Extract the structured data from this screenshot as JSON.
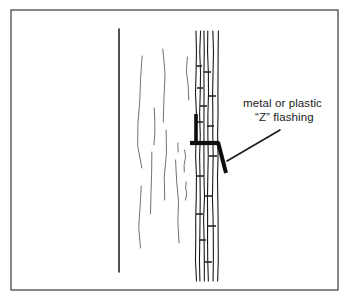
{
  "figure": {
    "name": "z-flashing-detail",
    "type": "architectural-detail-line-drawing",
    "background_color": "#ffffff",
    "ink_color": "#1a1a1a",
    "sketch_color": "#555555"
  },
  "frame": {
    "name": "border-rectangle",
    "x": 11,
    "y": 10,
    "width": 327,
    "height": 280,
    "stroke_color": "#3a3a3a",
    "stroke_width": 1.2
  },
  "annotation": {
    "label_line_1": "metal or plastic",
    "label_line_2": "“Z” flashing",
    "text_x": 243,
    "text_y_line_1": 107,
    "text_y_line_2": 121,
    "leader_from_x": 280,
    "leader_from_y": 130,
    "leader_to_x": 227,
    "leader_to_y": 161,
    "leader_stroke_width": 1.6
  },
  "wall_edge": {
    "name": "inner-wall-line",
    "x": 119,
    "y_top": 29,
    "y_bottom": 272,
    "stroke_width": 1.5,
    "color": "#1a1a1a"
  },
  "sheathing_strokes": [
    {
      "x": 140,
      "y1": 56,
      "y2": 168,
      "wobble": 2.4
    },
    {
      "x": 140,
      "y1": 186,
      "y2": 248,
      "wobble": 1.8
    },
    {
      "x": 155,
      "y1": 108,
      "y2": 145,
      "wobble": 1.4
    },
    {
      "x": 152,
      "y1": 152,
      "y2": 214,
      "wobble": 2.0
    },
    {
      "x": 165,
      "y1": 49,
      "y2": 122,
      "wobble": 2.2
    },
    {
      "x": 166,
      "y1": 130,
      "y2": 200,
      "wobble": 1.9
    },
    {
      "x": 178,
      "y1": 143,
      "y2": 152,
      "wobble": 0.6
    },
    {
      "x": 177,
      "y1": 160,
      "y2": 243,
      "wobble": 2.1
    },
    {
      "x": 188,
      "y1": 57,
      "y2": 100,
      "wobble": 1.6
    },
    {
      "x": 185,
      "y1": 150,
      "y2": 172,
      "wobble": 1.0
    },
    {
      "x": 186,
      "y1": 182,
      "y2": 200,
      "wobble": 0.9
    }
  ],
  "siding": {
    "name": "vertical-wood-siding",
    "x_left": 196,
    "x_right": 219,
    "y_top": 31,
    "y_bottom": 281,
    "board_line_count": 6,
    "board_lines_x": [
      196,
      200,
      204,
      208,
      213,
      218
    ],
    "stroke_width": 1.1,
    "joint_ticks": [
      {
        "x1": 196,
        "x2": 202,
        "y": 66
      },
      {
        "x1": 204,
        "x2": 211,
        "y": 72
      },
      {
        "x1": 197,
        "x2": 203,
        "y": 88
      },
      {
        "x1": 208,
        "x2": 216,
        "y": 96
      },
      {
        "x1": 200,
        "x2": 207,
        "y": 106
      },
      {
        "x1": 196,
        "x2": 203,
        "y": 122
      },
      {
        "x1": 207,
        "x2": 214,
        "y": 126
      },
      {
        "x1": 209,
        "x2": 217,
        "y": 156
      },
      {
        "x1": 197,
        "x2": 204,
        "y": 176
      },
      {
        "x1": 205,
        "x2": 212,
        "y": 196
      },
      {
        "x1": 196,
        "x2": 203,
        "y": 214
      },
      {
        "x1": 208,
        "x2": 216,
        "y": 226
      },
      {
        "x1": 199,
        "x2": 206,
        "y": 240
      },
      {
        "x1": 204,
        "x2": 212,
        "y": 262
      }
    ]
  },
  "flashing": {
    "name": "z-flashing-profile",
    "color": "#0d0d0d",
    "upper_leg": {
      "x": 196,
      "y_top": 114,
      "y_bottom": 142,
      "thickness": 3.6
    },
    "horizontal_arm": {
      "x_left": 190,
      "x_right": 219,
      "y": 143,
      "thickness": 4.2
    },
    "lower_drop_leg": {
      "x_top": 218,
      "y_top": 142,
      "x_bottom": 226,
      "y_bottom": 173,
      "thickness": 4.0
    }
  }
}
